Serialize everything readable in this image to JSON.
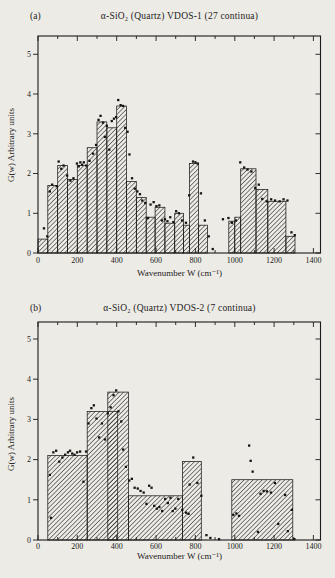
{
  "page": {
    "background_color": "#edebe6",
    "ink_color": "#1b1b1b",
    "hatch_color": "#2f2f2f"
  },
  "chart_data": [
    {
      "type": "bar",
      "panel_label": "(a)",
      "title": "α-SiO₂ (Quartz) VDOS-1 (27 continua)",
      "xlabel": "Wavenumber W (cm⁻¹)",
      "ylabel": "G(w) Arbitrary units",
      "xlim": [
        0,
        1400
      ],
      "ylim": [
        0,
        5
      ],
      "x_major_ticks": [
        0,
        200,
        400,
        600,
        800,
        1000,
        1200,
        1400
      ],
      "x_minor_step": 100,
      "y_ticks": [
        0,
        1,
        2,
        3,
        4,
        5
      ],
      "grid": false,
      "bar_style": "diagonal-hatch",
      "bars": [
        [
          0,
          50,
          0.35
        ],
        [
          50,
          100,
          1.7
        ],
        [
          100,
          150,
          2.2
        ],
        [
          150,
          200,
          1.85
        ],
        [
          200,
          250,
          2.2
        ],
        [
          250,
          300,
          2.65
        ],
        [
          300,
          350,
          3.3
        ],
        [
          350,
          400,
          3.15
        ],
        [
          400,
          450,
          3.7
        ],
        [
          450,
          500,
          1.8
        ],
        [
          500,
          550,
          1.4
        ],
        [
          550,
          595,
          0.9
        ],
        [
          595,
          645,
          1.15
        ],
        [
          645,
          695,
          0.75
        ],
        [
          695,
          740,
          1.0
        ],
        [
          740,
          770,
          0.7
        ],
        [
          770,
          815,
          2.25
        ],
        [
          815,
          862,
          0.7
        ],
        [
          970,
          1000,
          0.8
        ],
        [
          1000,
          1030,
          0.9
        ],
        [
          1030,
          1108,
          2.12
        ],
        [
          1108,
          1168,
          1.6
        ],
        [
          1168,
          1260,
          1.3
        ],
        [
          1260,
          1306,
          0.42
        ]
      ],
      "points": [
        [
          30,
          0.62
        ],
        [
          47,
          0.42
        ],
        [
          60,
          1.55
        ],
        [
          72,
          1.72
        ],
        [
          95,
          1.68
        ],
        [
          105,
          2.3
        ],
        [
          118,
          2.12
        ],
        [
          130,
          2.2
        ],
        [
          148,
          1.95
        ],
        [
          165,
          1.82
        ],
        [
          180,
          1.88
        ],
        [
          198,
          2.25
        ],
        [
          207,
          2.18
        ],
        [
          215,
          2.28
        ],
        [
          224,
          2.22
        ],
        [
          233,
          2.28
        ],
        [
          245,
          2.2
        ],
        [
          262,
          2.32
        ],
        [
          280,
          2.5
        ],
        [
          295,
          2.72
        ],
        [
          308,
          3.35
        ],
        [
          318,
          3.45
        ],
        [
          330,
          3.28
        ],
        [
          340,
          2.92
        ],
        [
          350,
          3.2
        ],
        [
          362,
          2.6
        ],
        [
          375,
          3.32
        ],
        [
          386,
          3.38
        ],
        [
          397,
          3.42
        ],
        [
          408,
          3.85
        ],
        [
          420,
          3.72
        ],
        [
          432,
          3.7
        ],
        [
          443,
          3.15
        ],
        [
          455,
          3.05
        ],
        [
          465,
          2.48
        ],
        [
          478,
          1.88
        ],
        [
          492,
          1.62
        ],
        [
          505,
          1.55
        ],
        [
          518,
          1.48
        ],
        [
          530,
          1.32
        ],
        [
          545,
          1.26
        ],
        [
          558,
          0.88
        ],
        [
          572,
          1.22
        ],
        [
          588,
          1.28
        ],
        [
          602,
          1.18
        ],
        [
          617,
          1.2
        ],
        [
          630,
          0.82
        ],
        [
          645,
          0.85
        ],
        [
          658,
          0.8
        ],
        [
          672,
          0.9
        ],
        [
          688,
          0.78
        ],
        [
          702,
          1.05
        ],
        [
          716,
          1.0
        ],
        [
          732,
          0.82
        ],
        [
          752,
          0.76
        ],
        [
          768,
          1.45
        ],
        [
          788,
          2.3
        ],
        [
          800,
          2.28
        ],
        [
          812,
          2.25
        ],
        [
          828,
          1.5
        ],
        [
          848,
          0.82
        ],
        [
          868,
          0.42
        ],
        [
          888,
          0.1
        ],
        [
          940,
          0.85
        ],
        [
          968,
          0.88
        ],
        [
          986,
          0.76
        ],
        [
          1006,
          0.82
        ],
        [
          1028,
          2.28
        ],
        [
          1048,
          2.15
        ],
        [
          1065,
          2.1
        ],
        [
          1085,
          2.05
        ],
        [
          1104,
          1.64
        ],
        [
          1122,
          1.72
        ],
        [
          1140,
          1.36
        ],
        [
          1162,
          1.3
        ],
        [
          1185,
          1.35
        ],
        [
          1205,
          1.32
        ],
        [
          1228,
          1.3
        ],
        [
          1248,
          1.35
        ],
        [
          1268,
          1.32
        ],
        [
          1288,
          0.52
        ],
        [
          1305,
          0.45
        ]
      ]
    },
    {
      "type": "bar",
      "panel_label": "(b)",
      "title": "α-SiO₂ (Quartz) VDOS-2 (7 continua)",
      "xlabel": "Wavenumber W (cm⁻¹)",
      "ylabel": "G(w) Arbitrary units",
      "xlim": [
        0,
        1400
      ],
      "ylim": [
        0,
        5
      ],
      "x_major_ticks": [
        0,
        200,
        400,
        600,
        800,
        1000,
        1200,
        1400
      ],
      "x_minor_step": 100,
      "y_ticks": [
        0,
        1,
        2,
        3,
        4,
        5
      ],
      "grid": false,
      "bar_style": "diagonal-hatch",
      "bars": [
        [
          50,
          250,
          2.1
        ],
        [
          250,
          405,
          3.2
        ],
        [
          355,
          460,
          3.68
        ],
        [
          460,
          735,
          1.1
        ],
        [
          735,
          830,
          1.95
        ],
        [
          985,
          1295,
          1.5
        ]
      ],
      "points": [
        [
          60,
          1.62
        ],
        [
          66,
          0.55
        ],
        [
          78,
          2.18
        ],
        [
          92,
          2.22
        ],
        [
          108,
          1.95
        ],
        [
          124,
          2.05
        ],
        [
          138,
          2.12
        ],
        [
          152,
          2.18
        ],
        [
          163,
          2.22
        ],
        [
          174,
          2.15
        ],
        [
          186,
          2.12
        ],
        [
          199,
          2.18
        ],
        [
          214,
          2.2
        ],
        [
          231,
          1.45
        ],
        [
          244,
          2.2
        ],
        [
          257,
          2.9
        ],
        [
          271,
          3.28
        ],
        [
          284,
          3.35
        ],
        [
          297,
          3.02
        ],
        [
          311,
          2.55
        ],
        [
          325,
          2.9
        ],
        [
          341,
          2.5
        ],
        [
          355,
          3.15
        ],
        [
          369,
          3.3
        ],
        [
          384,
          3.6
        ],
        [
          397,
          3.72
        ],
        [
          409,
          3.2
        ],
        [
          423,
          2.95
        ],
        [
          433,
          2.25
        ],
        [
          447,
          1.82
        ],
        [
          464,
          1.48
        ],
        [
          477,
          1.52
        ],
        [
          491,
          1.3
        ],
        [
          507,
          1.28
        ],
        [
          521,
          1.22
        ],
        [
          537,
          1.18
        ],
        [
          551,
          0.9
        ],
        [
          565,
          1.35
        ],
        [
          577,
          1.3
        ],
        [
          591,
          0.85
        ],
        [
          604,
          0.78
        ],
        [
          617,
          0.82
        ],
        [
          631,
          0.72
        ],
        [
          646,
          1.02
        ],
        [
          660,
          0.92
        ],
        [
          673,
          1.05
        ],
        [
          685,
          0.72
        ],
        [
          698,
          0.78
        ],
        [
          713,
          1.02
        ],
        [
          733,
          0.75
        ],
        [
          753,
          0.68
        ],
        [
          765,
          0.65
        ],
        [
          771,
          1.38
        ],
        [
          789,
          2.05
        ],
        [
          810,
          1.42
        ],
        [
          830,
          1.1
        ],
        [
          856,
          0.12
        ],
        [
          876,
          0.05
        ],
        [
          920,
          0.02
        ],
        [
          993,
          0.62
        ],
        [
          1008,
          0.66
        ],
        [
          1022,
          0.6
        ],
        [
          1073,
          2.35
        ],
        [
          1081,
          1.97
        ],
        [
          1091,
          1.7
        ],
        [
          1118,
          0.2
        ],
        [
          1131,
          1.15
        ],
        [
          1147,
          1.22
        ],
        [
          1163,
          1.21
        ],
        [
          1184,
          1.18
        ],
        [
          1204,
          1.42
        ],
        [
          1221,
          0.4
        ],
        [
          1256,
          1.12
        ],
        [
          1270,
          0.22
        ],
        [
          1290,
          0.75
        ],
        [
          1303,
          0.02
        ]
      ]
    }
  ]
}
